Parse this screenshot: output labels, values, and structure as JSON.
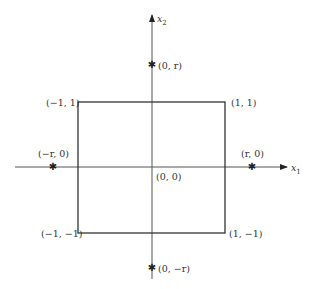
{
  "diagram": {
    "title": "",
    "axes": {
      "x_label": "x",
      "x_sub": "1",
      "y_label": "x",
      "y_sub": "2"
    },
    "rectangle": {
      "corners": [
        {
          "label": "(−1, 1)",
          "pos": "top-left"
        },
        {
          "label": "(1, 1)",
          "pos": "top-right"
        },
        {
          "label": "(−1, −1)",
          "pos": "bottom-left"
        },
        {
          "label": "(1, −1)",
          "pos": "bottom-right"
        }
      ]
    },
    "origin_label": "(0, 0)",
    "points": [
      {
        "label": "(0, r)",
        "marker": "✱"
      },
      {
        "label": "(−r, 0)",
        "marker": "✱"
      },
      {
        "label": "(r, 0)",
        "marker": "✱"
      },
      {
        "label": "(0, −r)",
        "marker": "✱"
      }
    ],
    "colors": {
      "axis": "#555555",
      "rect": "#333333",
      "text": "#333333"
    }
  }
}
